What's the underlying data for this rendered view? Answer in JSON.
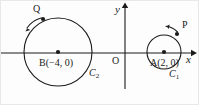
{
  "figure": {
    "background_color": "#fdfdfd",
    "stroke_color": "#1b1b1b",
    "width": 199,
    "height": 105
  },
  "axes": {
    "x_label": "x",
    "y_label": "y",
    "origin_label": "O",
    "x_axis_y": 52,
    "y_axis_x": 124,
    "x_axis_start": 0,
    "x_axis_end": 192,
    "y_axis_top": 5,
    "y_axis_bottom": 88
  },
  "circles": [
    {
      "name": "C1",
      "curve_label": "C",
      "curve_subscript": "1",
      "center_label": "A",
      "center_coords": "(2, 0)",
      "center_text": "A(2, 0)",
      "cx": 163,
      "cy": 51,
      "r": 17,
      "curve_label_x": 168,
      "curve_label_y": 68,
      "center_text_x": 150,
      "center_text_y": 57
    },
    {
      "name": "C2",
      "curve_label": "C",
      "curve_subscript": "2",
      "center_label": "B",
      "center_coords": "(−4, 0)",
      "center_text": "B(−4, 0)",
      "cx": 57,
      "cy": 51,
      "r": 34,
      "curve_label_x": 88,
      "curve_label_y": 67,
      "center_text_x": 38,
      "center_text_y": 57
    }
  ],
  "points": [
    {
      "label": "P",
      "on_circle": "C1",
      "x": 176,
      "y": 33,
      "label_x": 181,
      "label_y": 21,
      "direction": "counterclockwise",
      "arrow_note": "curved arrow pointing left along circle C1"
    },
    {
      "label": "Q",
      "on_circle": "C2",
      "x": 42,
      "y": 18,
      "label_x": 32,
      "label_y": 5,
      "direction": "counterclockwise",
      "arrow_note": "curved arrow pointing down-left along circle C2"
    }
  ]
}
